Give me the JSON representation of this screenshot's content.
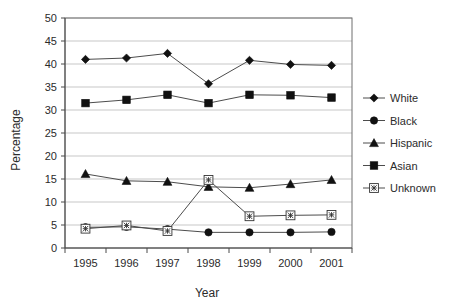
{
  "chart_data": {
    "type": "line",
    "title": "",
    "xlabel": "Year",
    "ylabel": "Percentage",
    "categories": [
      "1995",
      "1996",
      "1997",
      "1998",
      "1999",
      "2000",
      "2001"
    ],
    "x": [
      1995,
      1996,
      1997,
      1998,
      1999,
      2000,
      2001
    ],
    "ylim": [
      0,
      50
    ],
    "yticks": [
      0,
      5,
      10,
      15,
      20,
      25,
      30,
      35,
      40,
      45,
      50
    ],
    "ytick_labels": [
      "0",
      "5",
      "10",
      "15",
      "20",
      "25",
      "30",
      "35",
      "40",
      "45",
      "50"
    ],
    "grid": true,
    "legend_position": "right",
    "series": [
      {
        "name": "White",
        "marker": "diamond",
        "marker_style": "solid",
        "values": [
          41.0,
          41.3,
          42.3,
          35.7,
          40.8,
          39.9,
          39.7
        ]
      },
      {
        "name": "Black",
        "marker": "circle",
        "marker_style": "solid",
        "values": [
          4.5,
          4.6,
          4.1,
          3.4,
          3.4,
          3.4,
          3.5
        ]
      },
      {
        "name": "Hispanic",
        "marker": "triangle",
        "marker_style": "solid",
        "values": [
          16.1,
          14.6,
          14.4,
          13.3,
          13.1,
          13.9,
          14.8
        ]
      },
      {
        "name": "Asian",
        "marker": "square",
        "marker_style": "solid",
        "values": [
          31.5,
          32.2,
          33.3,
          31.5,
          33.3,
          33.2,
          32.7
        ]
      },
      {
        "name": "Unknown",
        "marker": "crossed-square",
        "marker_style": "open",
        "values": [
          4.2,
          4.9,
          3.7,
          14.8,
          6.9,
          7.1,
          7.2
        ]
      }
    ]
  },
  "legend": {
    "entries": [
      {
        "label": "White"
      },
      {
        "label": "Black"
      },
      {
        "label": "Hispanic"
      },
      {
        "label": "Asian"
      },
      {
        "label": "Unknown"
      }
    ]
  },
  "colors": {
    "marker": "#111111",
    "line": "#4c4c4c",
    "grid": "#b9b9b9",
    "border": "#6f6f6f",
    "text": "#2b2b2b",
    "background": "#ffffff"
  }
}
